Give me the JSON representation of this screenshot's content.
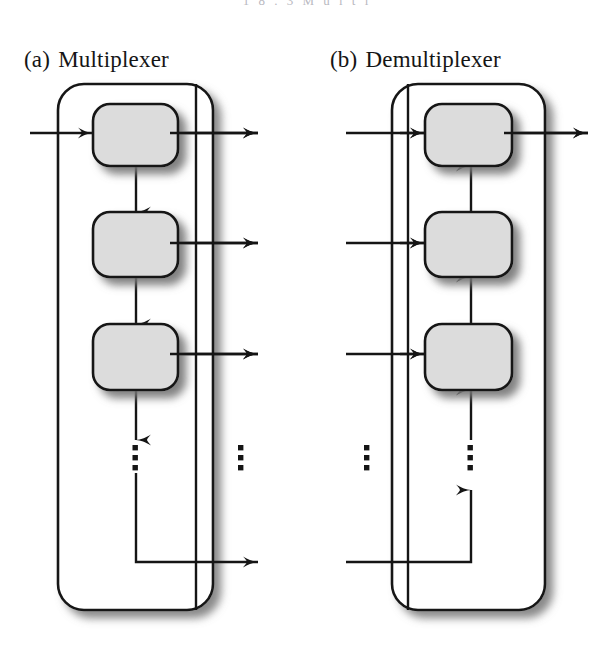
{
  "figure": {
    "page_header_fragment": "1 8 . 3   M u l t i",
    "background_color": "#ffffff",
    "ink_color": "#1a1a1a",
    "box_fill_color": "#dcdcdc",
    "shadow_color": "#8a8a8a",
    "panels": [
      {
        "id": "multiplexer",
        "tag": "(a)",
        "label": "Multiplexer",
        "caption": "(a)  Multiplexer",
        "direction": "merge",
        "stage_count": 3,
        "ellipsis_count": 2,
        "outer": {
          "x": 58,
          "y": 84,
          "width": 155,
          "height": 526,
          "radius": 26
        },
        "stages": [
          {
            "index": 1,
            "x": 93,
            "y": 104,
            "width": 85,
            "height": 62,
            "row_y": 133
          },
          {
            "index": 2,
            "x": 93,
            "y": 212,
            "width": 85,
            "height": 65,
            "row_y": 243
          },
          {
            "index": 3,
            "x": 93,
            "y": 324,
            "width": 85,
            "height": 66,
            "row_y": 354
          }
        ],
        "external_input_x": 30,
        "external_output_tip_x": 258,
        "bus_x": 196,
        "chain_x": 136,
        "tail_row_y": 562,
        "inner_dots_x": 136,
        "outer_dots_x": 241,
        "dots_y": [
          448,
          457,
          466
        ]
      },
      {
        "id": "demultiplexer",
        "tag": "(b)",
        "label": "Demultiplexer",
        "caption": "(b)  Demultiplexer",
        "direction": "split",
        "stage_count": 3,
        "ellipsis_count": 2,
        "outer": {
          "x": 392,
          "y": 84,
          "width": 153,
          "height": 526,
          "radius": 26
        },
        "stages": [
          {
            "index": 1,
            "x": 425,
            "y": 104,
            "width": 87,
            "height": 62,
            "row_y": 133
          },
          {
            "index": 2,
            "x": 425,
            "y": 212,
            "width": 87,
            "height": 65,
            "row_y": 243
          },
          {
            "index": 3,
            "x": 425,
            "y": 324,
            "width": 87,
            "height": 66,
            "row_y": 354
          }
        ],
        "external_input_x": 346,
        "external_output_tip_x": 588,
        "bus_x": 408,
        "chain_x": 471,
        "tail_row_y": 562,
        "inner_dots_x": 471,
        "outer_dots_x": 367,
        "dots_y": [
          448,
          457,
          466
        ]
      }
    ]
  }
}
